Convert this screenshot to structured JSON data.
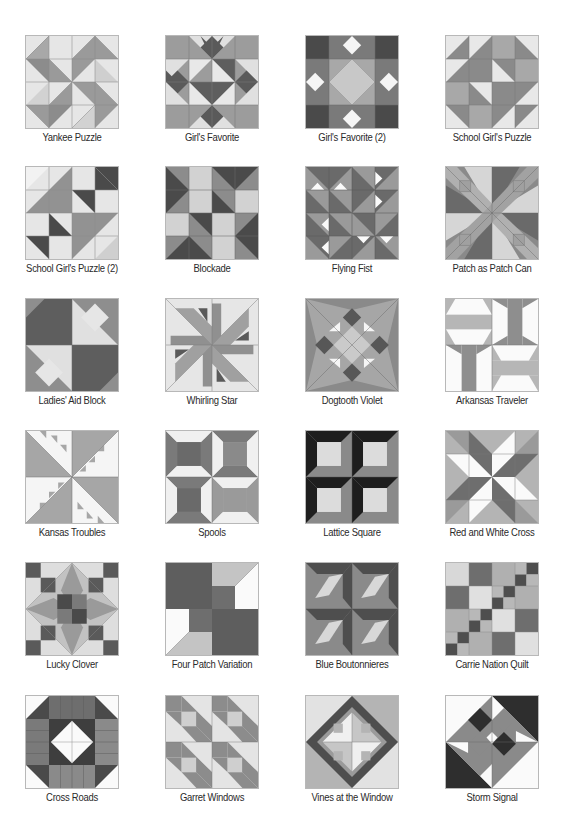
{
  "colors": {
    "white": "#fbfbfb",
    "light": "#e2e2e2",
    "mid_light": "#c4c4c4",
    "mid": "#a0a0a0",
    "dark": "#7a7a7a",
    "darker": "#575757",
    "black": "#2a2a2a",
    "line": "#8a8a8a"
  },
  "blocks": [
    {
      "name": "Yankee Puzzle"
    },
    {
      "name": "Girl's Favorite"
    },
    {
      "name": "Girl's Favorite (2)"
    },
    {
      "name": "School Girl's Puzzle"
    },
    {
      "name": "School Girl's Puzzle (2)"
    },
    {
      "name": "Blockade"
    },
    {
      "name": "Flying Fist"
    },
    {
      "name": "Patch as Patch Can"
    },
    {
      "name": "Ladies' Aid Block"
    },
    {
      "name": "Whirling Star"
    },
    {
      "name": "Dogtooth Violet"
    },
    {
      "name": "Arkansas Traveler"
    },
    {
      "name": "Kansas Troubles"
    },
    {
      "name": "Spools"
    },
    {
      "name": "Lattice Square"
    },
    {
      "name": "Red and White Cross"
    },
    {
      "name": "Lucky Clover"
    },
    {
      "name": "Four Patch Variation"
    },
    {
      "name": "Blue Boutonnieres"
    },
    {
      "name": "Carrie Nation Quilt"
    },
    {
      "name": "Cross Roads"
    },
    {
      "name": "Garret Windows"
    },
    {
      "name": "Vines at the Window"
    },
    {
      "name": "Storm Signal"
    }
  ]
}
